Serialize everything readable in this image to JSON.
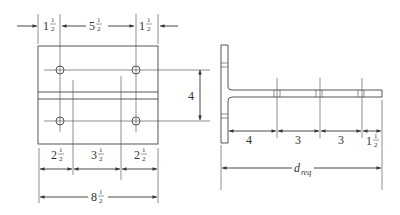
{
  "diagram": {
    "plate_view": {
      "top_dims": [
        {
          "whole": "1",
          "num": "1",
          "den": "2"
        },
        {
          "whole": "5",
          "num": "1",
          "den": "2"
        },
        {
          "whole": "1",
          "num": "1",
          "den": "2"
        }
      ],
      "bottom_dims": [
        {
          "whole": "2",
          "num": "1",
          "den": "2"
        },
        {
          "whole": "3",
          "num": "1",
          "den": "2"
        },
        {
          "whole": "2",
          "num": "1",
          "den": "2"
        }
      ],
      "overall_dim": {
        "whole": "8",
        "num": "1",
        "den": "2"
      }
    },
    "section_view": {
      "vertical_dim": "4",
      "web_dims": [
        {
          "whole": "4"
        },
        {
          "whole": "3"
        },
        {
          "whole": "3"
        },
        {
          "whole": "1",
          "num": "1",
          "den": "2"
        }
      ],
      "required_length": {
        "main": "d",
        "sub": "req"
      }
    },
    "colors": {
      "line": "#444444",
      "text": "#333333",
      "background": "#ffffff"
    }
  }
}
